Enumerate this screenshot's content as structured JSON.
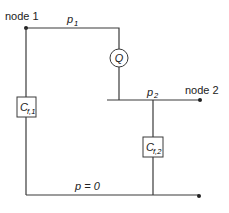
{
  "diagram": {
    "type": "hydraulic-network",
    "nodes": [
      {
        "id": "node1",
        "label": "node 1"
      },
      {
        "id": "node2",
        "label": "node 2"
      }
    ],
    "pressures": {
      "p1": {
        "symbol": "p",
        "subscript": "1"
      },
      "p2": {
        "symbol": "p",
        "subscript": "2"
      },
      "p0": {
        "text": "p = 0"
      }
    },
    "elements": {
      "flow_source": {
        "label": "Q"
      },
      "cf1": {
        "symbol": "C",
        "subscript": "f,1"
      },
      "cf2": {
        "symbol": "C",
        "subscript": "f,2"
      }
    },
    "colors": {
      "line": "#3a3a3a",
      "text": "#222222"
    }
  }
}
